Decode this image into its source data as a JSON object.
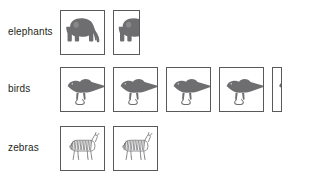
{
  "chart_data": {
    "type": "pictograph",
    "title": "",
    "xlabel": "",
    "ylabel": "",
    "orientation": "horizontal",
    "icon_fill_color": "#6e6e70",
    "icon_outline_color": "#58595b",
    "cell_border_color": "#58595b",
    "background_color": "#ffffff",
    "grid": false,
    "legend": false,
    "categories": [
      "elephants",
      "birds",
      "zebras"
    ],
    "values": [
      1.6,
      4.2,
      2.0
    ],
    "series": [
      {
        "name": "count",
        "values": [
          1.6,
          4.2,
          2.0
        ]
      }
    ],
    "rows": [
      {
        "label": "elephants",
        "icon": "elephant-icon",
        "full_icons": 1,
        "partial_fraction": 0.6,
        "value": 1.6
      },
      {
        "label": "birds",
        "icon": "bird-icon",
        "full_icons": 4,
        "partial_fraction": 0.22,
        "value": 4.2
      },
      {
        "label": "zebras",
        "icon": "zebra-icon",
        "full_icons": 2,
        "partial_fraction": 0,
        "value": 2.0
      }
    ]
  },
  "rows": {
    "elephants": {
      "label": "elephants"
    },
    "birds": {
      "label": "birds"
    },
    "zebras": {
      "label": "zebras"
    }
  }
}
